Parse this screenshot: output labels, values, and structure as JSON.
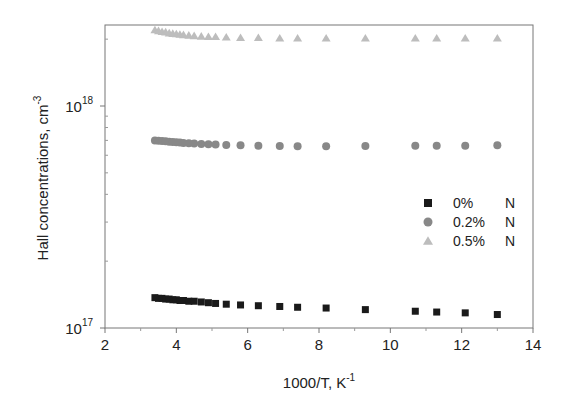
{
  "chart_data": {
    "type": "scatter",
    "title": "",
    "xlabel": "1000/T, K",
    "xlabel_superscript": "-1",
    "ylabel": "Hall concentrations, cm",
    "ylabel_superscript": "-3",
    "xlim": [
      2,
      14
    ],
    "ylim": [
      1e+17,
      2.5e+18
    ],
    "yscale": "log",
    "grid": false,
    "legend_position": "right-center",
    "x_ticks": [
      2,
      4,
      6,
      8,
      10,
      12,
      14
    ],
    "x_tick_labels": [
      "2",
      "4",
      "6",
      "8",
      "10",
      "12",
      "14"
    ],
    "y_ticks": [
      1e+17,
      1e+18
    ],
    "y_tick_labels": [
      {
        "base": "10",
        "exp": "17"
      },
      {
        "base": "10",
        "exp": "18"
      }
    ],
    "x": [
      3.4,
      3.5,
      3.6,
      3.7,
      3.8,
      3.9,
      4.0,
      4.1,
      4.2,
      4.35,
      4.5,
      4.7,
      4.9,
      5.1,
      5.4,
      5.8,
      6.3,
      6.9,
      7.4,
      8.2,
      9.3,
      10.7,
      11.3,
      12.1,
      13.0
    ],
    "series": [
      {
        "name": "0%    N",
        "marker": "square",
        "color": "#1a1a1a",
        "values": [
          1.37e+17,
          1.36e+17,
          1.36e+17,
          1.35e+17,
          1.35e+17,
          1.34e+17,
          1.34e+17,
          1.33e+17,
          1.33e+17,
          1.32e+17,
          1.32e+17,
          1.31e+17,
          1.3e+17,
          1.29e+17,
          1.28e+17,
          1.27e+17,
          1.26e+17,
          1.25e+17,
          1.24e+17,
          1.23e+17,
          1.21e+17,
          1.19e+17,
          1.18e+17,
          1.17e+17,
          1.15e+17
        ]
      },
      {
        "name": "0.2% N",
        "marker": "circle",
        "color": "#888888",
        "values": [
          7e+17,
          6.98e+17,
          6.95e+17,
          6.93e+17,
          6.9e+17,
          6.88e+17,
          6.86e+17,
          6.84e+17,
          6.82e+17,
          6.8e+17,
          6.78e+17,
          6.75e+17,
          6.72e+17,
          6.7e+17,
          6.68e+17,
          6.65e+17,
          6.62e+17,
          6.6e+17,
          6.58e+17,
          6.58e+17,
          6.6e+17,
          6.62e+17,
          6.62e+17,
          6.62e+17,
          6.65e+17
        ]
      },
      {
        "name": "0.5% N",
        "marker": "triangle",
        "color": "#bdbdbd",
        "values": [
          2.2e+18,
          2.18e+18,
          2.16e+18,
          2.15e+18,
          2.13e+18,
          2.12e+18,
          2.11e+18,
          2.1e+18,
          2.09e+18,
          2.08e+18,
          2.07e+18,
          2.06e+18,
          2.05e+18,
          2.05e+18,
          2.04e+18,
          2.03e+18,
          2.03e+18,
          2.02e+18,
          2.02e+18,
          2.02e+18,
          2.02e+18,
          2.02e+18,
          2.02e+18,
          2.02e+18,
          2.02e+18
        ]
      }
    ]
  },
  "legend": {
    "items": [
      {
        "label": "0%",
        "suffix": "N",
        "marker": "square",
        "color": "#1a1a1a"
      },
      {
        "label": "0.2%",
        "suffix": "N",
        "marker": "circle",
        "color": "#888888"
      },
      {
        "label": "0.5%",
        "suffix": "N",
        "marker": "triangle",
        "color": "#bdbdbd"
      }
    ]
  }
}
